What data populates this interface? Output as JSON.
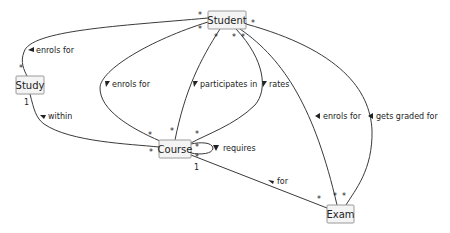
{
  "diagram": {
    "type": "UML class association diagram",
    "nodes": [
      {
        "id": "student",
        "label": "Student"
      },
      {
        "id": "study",
        "label": "Study"
      },
      {
        "id": "course",
        "label": "Course"
      },
      {
        "id": "exam",
        "label": "Exam"
      }
    ],
    "edges": [
      {
        "id": "student-study",
        "label": "enrols for",
        "from": "Student",
        "to": "Study",
        "mult_from": "*",
        "mult_to": "*"
      },
      {
        "id": "study-course",
        "label": "within",
        "from": "Study",
        "to": "Course",
        "mult_from": "1",
        "mult_to": "*"
      },
      {
        "id": "student-course-enrols",
        "label": "enrols for",
        "from": "Student",
        "to": "Course",
        "mult_from": "*",
        "mult_to": "*"
      },
      {
        "id": "student-course-participates",
        "label": "participates in",
        "from": "Student",
        "to": "Course",
        "mult_from": "*",
        "mult_to": "*"
      },
      {
        "id": "student-course-rates",
        "label": "rates",
        "from": "Student",
        "to": "Course",
        "mult_from": "*",
        "mult_to": "*"
      },
      {
        "id": "course-requires",
        "label": "requires",
        "from": "Course",
        "to": "Course",
        "mult_from": "*",
        "mult_to": "*"
      },
      {
        "id": "course-exam",
        "label": "for",
        "from": "Course",
        "to": "Exam",
        "mult_from": "1",
        "mult_to": "*"
      },
      {
        "id": "student-exam-enrols",
        "label": "enrols for",
        "from": "Student",
        "to": "Exam",
        "mult_from": "*",
        "mult_to": "*"
      },
      {
        "id": "student-exam-graded",
        "label": "gets graded for",
        "from": "Student",
        "to": "Exam",
        "mult_from": "*",
        "mult_to": "*"
      }
    ],
    "multiplicity": {
      "many": "*",
      "one": "1"
    }
  }
}
